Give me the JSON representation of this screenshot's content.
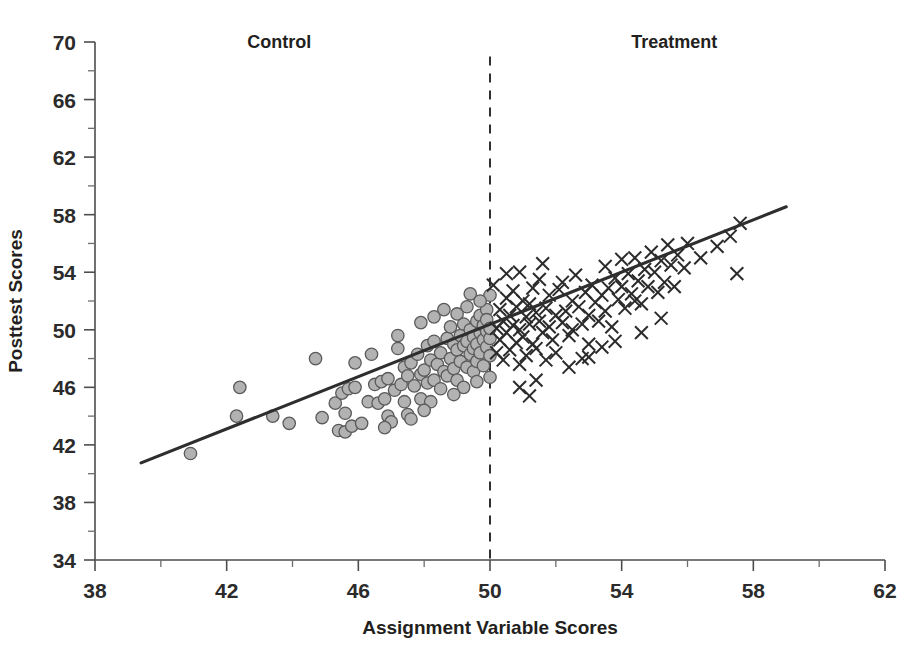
{
  "chart_data": {
    "type": "scatter",
    "title": "",
    "xlabel": "Assignment Variable Scores",
    "ylabel": "Posttest Scores",
    "xlim": [
      38,
      62
    ],
    "ylim": [
      34,
      70
    ],
    "x_major_ticks": [
      38,
      42,
      46,
      50,
      54,
      58,
      62
    ],
    "x_minor_ticks": [
      40,
      44,
      48,
      52,
      56,
      60
    ],
    "y_major_ticks": [
      34,
      38,
      42,
      46,
      50,
      54,
      58,
      62,
      66,
      70
    ],
    "y_minor_ticks": [
      36,
      40,
      44,
      48,
      52,
      56,
      60,
      64,
      68
    ],
    "grid": false,
    "legend_position": "none",
    "annotations": [
      {
        "name": "control-label",
        "text": "Control",
        "x": 43.6,
        "y": 69.6
      },
      {
        "name": "treatment-label",
        "text": "Treatment",
        "x": 55.6,
        "y": 69.6
      }
    ],
    "cutoff": {
      "x": 50,
      "style": "dashed",
      "label": "assignment cutoff",
      "y_from": 34,
      "y_to": 69.0
    },
    "fit_line": {
      "name": "regression-fit",
      "x_from": 39.4,
      "y_from": 40.75,
      "x_to": 59.0,
      "y_to": 58.55
    },
    "series": [
      {
        "name": "Control",
        "marker": "circle",
        "color": "#b2b2b2",
        "edge_color": "#5a5a5a",
        "points": [
          [
            40.9,
            41.4
          ],
          [
            42.4,
            46.0
          ],
          [
            42.3,
            44.0
          ],
          [
            43.4,
            44.0
          ],
          [
            43.9,
            43.5
          ],
          [
            44.7,
            48.0
          ],
          [
            44.9,
            43.9
          ],
          [
            45.3,
            44.9
          ],
          [
            45.4,
            43.0
          ],
          [
            45.5,
            45.6
          ],
          [
            45.6,
            44.2
          ],
          [
            45.6,
            42.9
          ],
          [
            45.7,
            45.9
          ],
          [
            45.8,
            43.3
          ],
          [
            45.9,
            46.0
          ],
          [
            46.1,
            43.5
          ],
          [
            46.3,
            45.0
          ],
          [
            46.5,
            46.2
          ],
          [
            46.6,
            44.9
          ],
          [
            46.7,
            46.4
          ],
          [
            46.8,
            45.2
          ],
          [
            46.9,
            44.0
          ],
          [
            46.9,
            46.6
          ],
          [
            47.0,
            43.6
          ],
          [
            47.1,
            45.8
          ],
          [
            47.2,
            48.7
          ],
          [
            47.3,
            46.2
          ],
          [
            47.4,
            47.4
          ],
          [
            47.4,
            45.0
          ],
          [
            47.5,
            46.8
          ],
          [
            47.5,
            44.1
          ],
          [
            47.6,
            47.7
          ],
          [
            47.7,
            46.1
          ],
          [
            47.8,
            48.3
          ],
          [
            47.9,
            46.9
          ],
          [
            47.9,
            45.2
          ],
          [
            48.0,
            47.2
          ],
          [
            48.1,
            48.9
          ],
          [
            48.1,
            46.3
          ],
          [
            48.2,
            47.9
          ],
          [
            48.3,
            46.5
          ],
          [
            48.3,
            49.2
          ],
          [
            48.4,
            47.6
          ],
          [
            48.5,
            45.9
          ],
          [
            48.5,
            48.4
          ],
          [
            48.6,
            47.1
          ],
          [
            48.7,
            49.4
          ],
          [
            48.7,
            46.8
          ],
          [
            48.8,
            48.0
          ],
          [
            48.8,
            50.2
          ],
          [
            48.9,
            47.3
          ],
          [
            48.9,
            49.0
          ],
          [
            49.0,
            48.6
          ],
          [
            49.0,
            46.5
          ],
          [
            49.1,
            49.6
          ],
          [
            49.1,
            47.8
          ],
          [
            49.2,
            48.9
          ],
          [
            49.2,
            50.4
          ],
          [
            49.3,
            47.4
          ],
          [
            49.3,
            49.2
          ],
          [
            49.4,
            48.3
          ],
          [
            49.4,
            50.0
          ],
          [
            49.5,
            49.5
          ],
          [
            49.5,
            47.1
          ],
          [
            49.5,
            48.7
          ],
          [
            49.6,
            50.6
          ],
          [
            49.6,
            49.0
          ],
          [
            49.6,
            47.8
          ],
          [
            49.7,
            49.8
          ],
          [
            49.7,
            48.4
          ],
          [
            49.7,
            51.0
          ],
          [
            49.8,
            49.3
          ],
          [
            49.8,
            50.3
          ],
          [
            49.8,
            47.5
          ],
          [
            49.9,
            49.9
          ],
          [
            49.9,
            48.8
          ],
          [
            49.9,
            51.4
          ],
          [
            49.9,
            50.7
          ],
          [
            50.0,
            49.4
          ],
          [
            50.0,
            50.1
          ],
          [
            50.0,
            48.2
          ],
          [
            50.0,
            52.4
          ],
          [
            49.4,
            52.5
          ],
          [
            49.3,
            51.6
          ],
          [
            48.6,
            51.4
          ],
          [
            48.3,
            50.9
          ],
          [
            47.9,
            50.5
          ],
          [
            47.2,
            49.6
          ],
          [
            46.4,
            48.3
          ],
          [
            45.9,
            47.7
          ],
          [
            49.0,
            51.1
          ],
          [
            49.7,
            52.0
          ],
          [
            48.2,
            45.0
          ],
          [
            47.6,
            43.8
          ],
          [
            46.8,
            43.2
          ],
          [
            49.2,
            46.0
          ],
          [
            49.6,
            46.4
          ],
          [
            50.0,
            46.7
          ],
          [
            48.9,
            45.5
          ],
          [
            48.0,
            44.4
          ]
        ]
      },
      {
        "name": "Treatment",
        "marker": "x",
        "color": "#2b2b2b",
        "points": [
          [
            50.1,
            53.1
          ],
          [
            50.2,
            50.1
          ],
          [
            50.2,
            48.4
          ],
          [
            50.3,
            51.4
          ],
          [
            50.3,
            49.3
          ],
          [
            50.4,
            50.6
          ],
          [
            50.4,
            47.9
          ],
          [
            50.5,
            52.2
          ],
          [
            50.5,
            49.8
          ],
          [
            50.6,
            51.0
          ],
          [
            50.6,
            48.6
          ],
          [
            50.7,
            50.3
          ],
          [
            50.7,
            52.7
          ],
          [
            50.8,
            49.1
          ],
          [
            50.8,
            51.6
          ],
          [
            50.9,
            50.0
          ],
          [
            50.9,
            47.6
          ],
          [
            51.0,
            52.0
          ],
          [
            51.0,
            49.5
          ],
          [
            51.1,
            50.9
          ],
          [
            51.1,
            48.2
          ],
          [
            51.2,
            51.8
          ],
          [
            51.2,
            50.4
          ],
          [
            51.3,
            49.0
          ],
          [
            51.3,
            52.9
          ],
          [
            51.4,
            51.2
          ],
          [
            51.4,
            48.7
          ],
          [
            51.5,
            50.6
          ],
          [
            51.5,
            53.5
          ],
          [
            51.6,
            49.8
          ],
          [
            51.7,
            51.5
          ],
          [
            51.7,
            47.9
          ],
          [
            51.8,
            50.2
          ],
          [
            51.8,
            52.4
          ],
          [
            51.9,
            49.3
          ],
          [
            52.0,
            51.0
          ],
          [
            52.0,
            48.4
          ],
          [
            52.1,
            52.8
          ],
          [
            52.2,
            50.5
          ],
          [
            52.2,
            53.3
          ],
          [
            52.3,
            51.3
          ],
          [
            52.4,
            49.6
          ],
          [
            52.5,
            52.0
          ],
          [
            52.5,
            50.0
          ],
          [
            52.6,
            53.8
          ],
          [
            52.7,
            51.6
          ],
          [
            52.8,
            50.4
          ],
          [
            52.9,
            52.6
          ],
          [
            53.0,
            51.0
          ],
          [
            53.0,
            49.0
          ],
          [
            53.1,
            53.1
          ],
          [
            53.2,
            51.9
          ],
          [
            53.3,
            50.6
          ],
          [
            53.4,
            52.4
          ],
          [
            53.5,
            54.4
          ],
          [
            53.5,
            51.3
          ],
          [
            53.6,
            52.9
          ],
          [
            53.7,
            50.2
          ],
          [
            53.8,
            53.6
          ],
          [
            53.9,
            52.1
          ],
          [
            54.0,
            54.9
          ],
          [
            54.0,
            53.0
          ],
          [
            54.1,
            51.5
          ],
          [
            54.2,
            53.9
          ],
          [
            54.3,
            52.5
          ],
          [
            54.4,
            55.0
          ],
          [
            54.5,
            53.4
          ],
          [
            54.6,
            51.8
          ],
          [
            54.7,
            54.2
          ],
          [
            54.8,
            53.0
          ],
          [
            54.9,
            55.4
          ],
          [
            55.0,
            54.0
          ],
          [
            55.1,
            52.6
          ],
          [
            55.2,
            54.8
          ],
          [
            55.3,
            53.3
          ],
          [
            55.4,
            55.9
          ],
          [
            55.5,
            54.5
          ],
          [
            55.6,
            53.0
          ],
          [
            55.7,
            55.2
          ],
          [
            55.9,
            54.3
          ],
          [
            56.0,
            56.0
          ],
          [
            56.4,
            55.0
          ],
          [
            56.9,
            55.8
          ],
          [
            57.3,
            56.5
          ],
          [
            57.6,
            57.4
          ],
          [
            57.5,
            53.9
          ],
          [
            55.2,
            50.8
          ],
          [
            54.6,
            49.8
          ],
          [
            53.8,
            49.2
          ],
          [
            53.0,
            48.1
          ],
          [
            52.4,
            47.4
          ],
          [
            51.4,
            46.5
          ],
          [
            50.9,
            46.0
          ],
          [
            51.2,
            45.4
          ],
          [
            54.4,
            52.0
          ],
          [
            50.5,
            53.9
          ],
          [
            50.9,
            54.0
          ],
          [
            51.6,
            54.6
          ],
          [
            52.8,
            48.0
          ],
          [
            53.4,
            48.8
          ]
        ]
      }
    ]
  },
  "axis_labels": {
    "x_title": "Assignment Variable Scores",
    "y_title": "Posttest Scores"
  },
  "group_labels": {
    "control": "Control",
    "treatment": "Treatment"
  }
}
